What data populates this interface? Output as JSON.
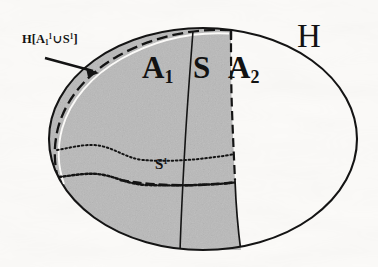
{
  "figure": {
    "kind": "mathematical-set-diagram",
    "background_color": "#fbfaf8",
    "ink_color": "#141414",
    "shade_color": "#b9b9b9"
  },
  "labels": {
    "region_A1": {
      "base": "A",
      "sub": "1",
      "sup": ""
    },
    "region_S": {
      "base": "S",
      "sub": "",
      "sup": ""
    },
    "region_A2": {
      "base": "A",
      "sub": "2",
      "sup": ""
    },
    "region_H": {
      "base": "H",
      "sub": "",
      "sup": ""
    },
    "band_S1": {
      "base": "S",
      "sub": "",
      "sup": "1"
    },
    "callout": {
      "text": "H[A₁¹ ∪ S¹]",
      "h": "H",
      "open_bracket": "[",
      "a": "A",
      "a_sub": "1",
      "a_sup": "1",
      "union": "∪",
      "s": "S",
      "s_sup": "1",
      "close_bracket": "]"
    }
  },
  "annotations": {
    "arrow": {
      "name": "callout-arrow",
      "from": [
        45,
        58
      ],
      "to": [
        99,
        73
      ],
      "points_to": "outer-boundary-band"
    }
  },
  "geometry": {
    "outer_ellipse": {
      "cx": 203,
      "cy": 139,
      "rx": 154,
      "ry": 111
    },
    "shaded_right_edge_top_x": 231,
    "shaded_right_edge_bottom_x": 241,
    "divider_A1_S_top_x": 193,
    "divider_A1_S_bottom_x": 180,
    "band_S1_top_y": 152,
    "band_S1_bottom_y": 185
  }
}
